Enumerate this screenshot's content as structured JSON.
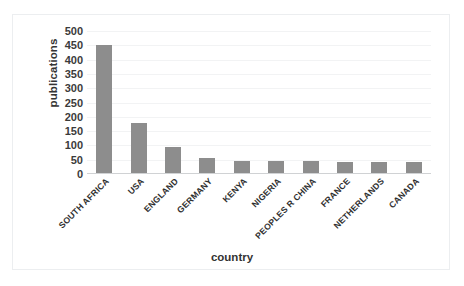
{
  "chart_data": {
    "type": "bar",
    "title": "",
    "xlabel": "country",
    "ylabel": "publications",
    "categories": [
      "SOUTH AFRICA",
      "USA",
      "ENGLAND",
      "GERMANY",
      "KENYA",
      "NIGERIA",
      "PEOPLES R CHINA",
      "FRANCE",
      "NETHERLANDS",
      "CANADA"
    ],
    "values": [
      450,
      178,
      95,
      57,
      45,
      45,
      45,
      43,
      42,
      42
    ],
    "ylim": [
      0,
      500
    ],
    "ytick_labels": [
      "500",
      "450",
      "400",
      "350",
      "300",
      "250",
      "200",
      "150",
      "100",
      "50",
      "0"
    ],
    "ytick_values": [
      500,
      450,
      400,
      350,
      300,
      250,
      200,
      150,
      100,
      50,
      0
    ],
    "ytick_step": 50,
    "grid": true,
    "legend": false,
    "bar_color": "#8d8d8d",
    "gridline_color": "#f2f3f4",
    "axis_color": "#d0d2d4",
    "border_color": "#eceef0"
  }
}
